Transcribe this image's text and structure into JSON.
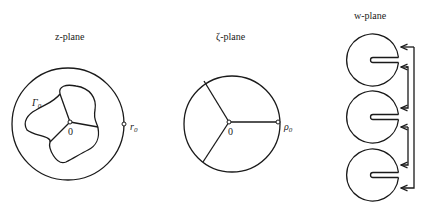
{
  "figure": {
    "panels": [
      {
        "id": "z",
        "title": "z-plane",
        "labels": {
          "curve": "Γ₀",
          "curve_base": "Γ",
          "curve_sub": "0",
          "origin": "0",
          "radius_point": "r₀",
          "radius_base": "r",
          "radius_sub": "0"
        }
      },
      {
        "id": "zeta",
        "title": "ζ-plane",
        "labels": {
          "origin": "0",
          "radius_point": "ρ₀",
          "radius_base": "ρ",
          "radius_sub": "0"
        }
      },
      {
        "id": "w",
        "title": "w-plane",
        "sheets": 3
      }
    ],
    "colors": {
      "ink": "#1a1a1a",
      "background": "#ffffff"
    }
  }
}
